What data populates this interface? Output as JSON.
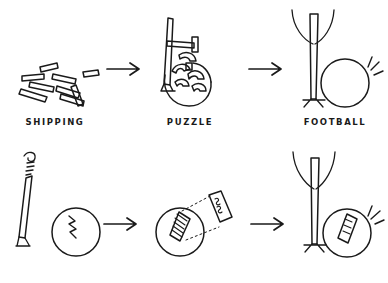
{
  "canvas": {
    "width": 388,
    "height": 283,
    "background": "#ffffff",
    "ink": "#1a1a1a",
    "style": "hand-drawn-sketch"
  },
  "labels": {
    "shipping": "SHIPPING",
    "puzzle": "PUZZLE",
    "football": "FOOTBALL"
  },
  "rows": [
    {
      "name": "assembly-sequence",
      "panels": [
        {
          "name": "scattered-sticks",
          "label": "SHIPPING",
          "description": "loose flat rods scattered"
        },
        {
          "name": "tangled-assembly",
          "label": "PUZZLE",
          "description": "jumbled partly-built frame over ball"
        },
        {
          "name": "goalpost-and-ball",
          "label": "FOOTBALL",
          "description": "upright post with raised arms beside ball with motion marks"
        }
      ],
      "arrows": 2
    },
    {
      "name": "repair-sequence",
      "panels": [
        {
          "name": "broken-post-and-cracked-ball",
          "label": "",
          "description": "bent drooping post with frustration squiggle beside ball with zigzag crack"
        },
        {
          "name": "patch-application",
          "label": "",
          "description": "ball with hatched patch and dotted guide line to detached patch piece"
        },
        {
          "name": "repaired-post-and-patched-ball",
          "label": "",
          "description": "upright post with raised arms beside patched ball with motion marks"
        }
      ],
      "arrows": 2
    }
  ],
  "icons": {
    "arrow": "arrow-right-icon",
    "squiggle": "frustration-squiggle-icon",
    "crack": "zigzag-crack-icon",
    "sparks": "impact-lines-icon",
    "patch": "hatched-patch-icon",
    "dotted_guide": "dotted-guide-line-icon"
  }
}
